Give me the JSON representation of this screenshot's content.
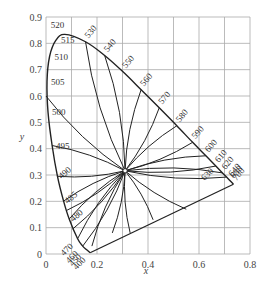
{
  "chart_data": {
    "type": "line",
    "title": "",
    "xlabel": "x",
    "ylabel": "y",
    "xlim": [
      0,
      0.8
    ],
    "ylim": [
      0,
      0.9
    ],
    "grid": true,
    "x_ticks": [
      "0",
      "0.2",
      "0.4",
      "0.6",
      "0.8"
    ],
    "y_ticks": [
      "0",
      "0.1",
      "0.2",
      "0.3",
      "0.4",
      "0.5",
      "0.6",
      "0.7",
      "0.8",
      "0.9"
    ],
    "white_point": {
      "x": 0.31,
      "y": 0.316
    },
    "spectral_locus": [
      {
        "wl": 400,
        "x": 0.173,
        "y": 0.005
      },
      {
        "wl": 450,
        "x": 0.157,
        "y": 0.018
      },
      {
        "wl": 460,
        "x": 0.144,
        "y": 0.03
      },
      {
        "wl": 470,
        "x": 0.124,
        "y": 0.058
      },
      {
        "wl": 480,
        "x": 0.091,
        "y": 0.133
      },
      {
        "wl": 485,
        "x": 0.069,
        "y": 0.201
      },
      {
        "wl": 490,
        "x": 0.045,
        "y": 0.295
      },
      {
        "wl": 495,
        "x": 0.024,
        "y": 0.412
      },
      {
        "wl": 500,
        "x": 0.008,
        "y": 0.538
      },
      {
        "wl": 505,
        "x": 0.004,
        "y": 0.655
      },
      {
        "wl": 510,
        "x": 0.014,
        "y": 0.75
      },
      {
        "wl": 515,
        "x": 0.039,
        "y": 0.812
      },
      {
        "wl": 520,
        "x": 0.074,
        "y": 0.834
      },
      {
        "wl": 530,
        "x": 0.155,
        "y": 0.806
      },
      {
        "wl": 540,
        "x": 0.23,
        "y": 0.754
      },
      {
        "wl": 550,
        "x": 0.302,
        "y": 0.692
      },
      {
        "wl": 560,
        "x": 0.373,
        "y": 0.624
      },
      {
        "wl": 570,
        "x": 0.444,
        "y": 0.555
      },
      {
        "wl": 580,
        "x": 0.513,
        "y": 0.487
      },
      {
        "wl": 590,
        "x": 0.575,
        "y": 0.424
      },
      {
        "wl": 600,
        "x": 0.627,
        "y": 0.373
      },
      {
        "wl": 610,
        "x": 0.666,
        "y": 0.334
      },
      {
        "wl": 620,
        "x": 0.692,
        "y": 0.308
      },
      {
        "wl": 630,
        "x": 0.708,
        "y": 0.292
      },
      {
        "wl": 640,
        "x": 0.719,
        "y": 0.281
      },
      {
        "wl": 650,
        "x": 0.726,
        "y": 0.274
      },
      {
        "wl": 700,
        "x": 0.735,
        "y": 0.265
      }
    ],
    "wavelength_labels": [
      "400",
      "450",
      "460",
      "470",
      "480",
      "485",
      "490",
      "495",
      "500",
      "505",
      "510",
      "515",
      "520",
      "530",
      "540",
      "550",
      "560",
      "570",
      "580",
      "590",
      "600",
      "610",
      "620",
      "630",
      "640",
      "650",
      "700"
    ],
    "hue_lines_from_white_point_to": [
      {
        "x": 0.0,
        "y": 0.6
      },
      {
        "x": 0.024,
        "y": 0.412
      },
      {
        "x": 0.045,
        "y": 0.295
      },
      {
        "x": 0.069,
        "y": 0.201
      },
      {
        "x": 0.08,
        "y": 0.165
      },
      {
        "x": 0.091,
        "y": 0.133
      },
      {
        "x": 0.105,
        "y": 0.095
      },
      {
        "x": 0.124,
        "y": 0.058
      },
      {
        "x": 0.144,
        "y": 0.03
      },
      {
        "x": 0.18,
        "y": 0.03
      },
      {
        "x": 0.26,
        "y": 0.08
      },
      {
        "x": 0.33,
        "y": 0.08
      },
      {
        "x": 0.42,
        "y": 0.13
      },
      {
        "x": 0.55,
        "y": 0.17
      },
      {
        "x": 0.155,
        "y": 0.806
      },
      {
        "x": 0.23,
        "y": 0.754
      },
      {
        "x": 0.373,
        "y": 0.624
      },
      {
        "x": 0.444,
        "y": 0.555
      },
      {
        "x": 0.513,
        "y": 0.487
      },
      {
        "x": 0.575,
        "y": 0.424
      },
      {
        "x": 0.627,
        "y": 0.373
      },
      {
        "x": 0.666,
        "y": 0.334
      },
      {
        "x": 0.692,
        "y": 0.308
      },
      {
        "x": 0.708,
        "y": 0.292
      }
    ]
  }
}
